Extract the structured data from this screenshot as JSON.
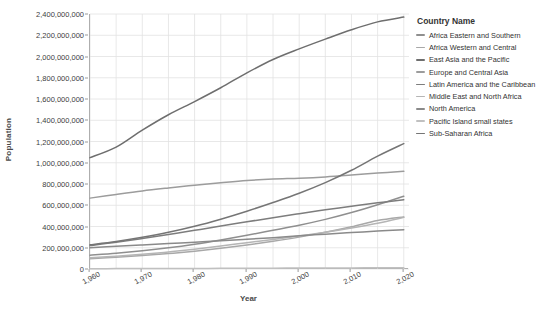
{
  "chart_data": {
    "type": "line",
    "title": "",
    "xlabel": "Year",
    "ylabel": "Population",
    "legend_title": "Country Name",
    "legend_position": "right",
    "grid": true,
    "xlim": [
      1960,
      2021
    ],
    "ylim": [
      0,
      2400000000
    ],
    "x_ticks": [
      "1,960",
      "1,970",
      "1,980",
      "1,990",
      "2,000",
      "2,010",
      "2,020"
    ],
    "x_tick_values": [
      1960,
      1970,
      1980,
      1990,
      2000,
      2010,
      2020
    ],
    "y_ticks": [
      "0",
      "200,000,000",
      "400,000,000",
      "600,000,000",
      "800,000,000",
      "1,000,000,000",
      "1,200,000,000",
      "1,400,000,000",
      "1,600,000,000",
      "1,800,000,000",
      "2,000,000,000",
      "2,200,000,000",
      "2,400,000,000"
    ],
    "y_tick_values": [
      0,
      200000000,
      400000000,
      600000000,
      800000000,
      1000000000,
      1200000000,
      1400000000,
      1600000000,
      1800000000,
      2000000000,
      2200000000,
      2400000000
    ],
    "x": [
      1960,
      1965,
      1970,
      1975,
      1980,
      1985,
      1990,
      1995,
      2000,
      2005,
      2010,
      2015,
      2020
    ],
    "series": [
      {
        "name": "Africa Eastern and Southern",
        "color": "#8f8f8f",
        "values": [
          130000000,
          148000000,
          171000000,
          199000000,
          233000000,
          273000000,
          317000000,
          364000000,
          412000000,
          467000000,
          531000000,
          605000000,
          685000000
        ]
      },
      {
        "name": "Africa Western and Central",
        "color": "#a8a8a8",
        "values": [
          97000000,
          110000000,
          126000000,
          145000000,
          168000000,
          195000000,
          226000000,
          261000000,
          300000000,
          345000000,
          397000000,
          456000000,
          490000000
        ]
      },
      {
        "name": "East Asia and the Pacific",
        "color": "#6e6e6e",
        "values": [
          1048000000,
          1147000000,
          1307000000,
          1452000000,
          1576000000,
          1706000000,
          1846000000,
          1972000000,
          2072000000,
          2164000000,
          2252000000,
          2326000000,
          2371000000
        ]
      },
      {
        "name": "Europe and Central Asia",
        "color": "#9c9c9c",
        "values": [
          667000000,
          702000000,
          735000000,
          763000000,
          789000000,
          812000000,
          833000000,
          847000000,
          855000000,
          867000000,
          884000000,
          903000000,
          919000000
        ]
      },
      {
        "name": "Latin America and the Caribbean",
        "color": "#7d7d7d",
        "values": [
          220000000,
          251000000,
          287000000,
          325000000,
          364000000,
          404000000,
          444000000,
          483000000,
          521000000,
          557000000,
          591000000,
          623000000,
          652000000
        ]
      },
      {
        "name": "Middle East and North Africa",
        "color": "#b5b5b5",
        "values": [
          105000000,
          120000000,
          138000000,
          160000000,
          186000000,
          216000000,
          248000000,
          277000000,
          310000000,
          345000000,
          385000000,
          431000000,
          486000000
        ]
      },
      {
        "name": "North America",
        "color": "#8a8a8a",
        "values": [
          199000000,
          214000000,
          227000000,
          239000000,
          252000000,
          265000000,
          280000000,
          295000000,
          313000000,
          328000000,
          343000000,
          357000000,
          370000000
        ]
      },
      {
        "name": "Pacific Island small states",
        "color": "#c0c0c0",
        "values": [
          3200000,
          3700000,
          4200000,
          4800000,
          5500000,
          6200000,
          7000000,
          7800000,
          8700000,
          9500000,
          10300000,
          11200000,
          12200000
        ]
      },
      {
        "name": "Sub-Saharan Africa",
        "color": "#757575",
        "values": [
          228000000,
          259000000,
          298000000,
          345000000,
          402000000,
          469000000,
          544000000,
          626000000,
          713000000,
          813000000,
          929000000,
          1062000000,
          1180000000
        ]
      }
    ]
  }
}
